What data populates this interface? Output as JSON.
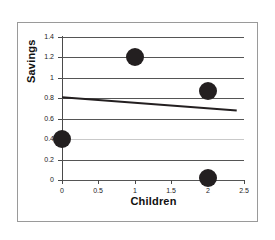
{
  "chart_data": {
    "type": "scatter",
    "title": "",
    "xlabel": "Children",
    "ylabel": "Savings",
    "xlim": [
      0,
      2.5
    ],
    "ylim": [
      0,
      1.4
    ],
    "grid": true,
    "legend": "none",
    "x_ticks": [
      "0",
      "0.5",
      "1",
      "1.5",
      "2",
      "2.5"
    ],
    "x_tick_values": [
      0,
      0.5,
      1,
      1.5,
      2,
      2.5
    ],
    "y_ticks": [
      "0",
      "0.2",
      "0.4",
      "0.6",
      "0.8",
      "1",
      "1.2",
      "1.4"
    ],
    "y_tick_values": [
      0,
      0.2,
      0.4,
      0.6,
      0.8,
      1,
      1.2,
      1.4
    ],
    "series": [
      {
        "name": "Observations",
        "type": "scatter",
        "marker": "filled-circle",
        "color": "#231f20",
        "points": [
          {
            "x": 0,
            "y": 0.4
          },
          {
            "x": 1,
            "y": 1.2
          },
          {
            "x": 2,
            "y": 0.87
          },
          {
            "x": 2,
            "y": 0.02
          }
        ]
      },
      {
        "name": "Trend line",
        "type": "line",
        "color": "#231f20",
        "points": [
          {
            "x": 0,
            "y": 0.81
          },
          {
            "x": 2.4,
            "y": 0.68
          }
        ]
      }
    ]
  },
  "axes": {
    "x_title": "Children",
    "y_title": "Savings"
  }
}
